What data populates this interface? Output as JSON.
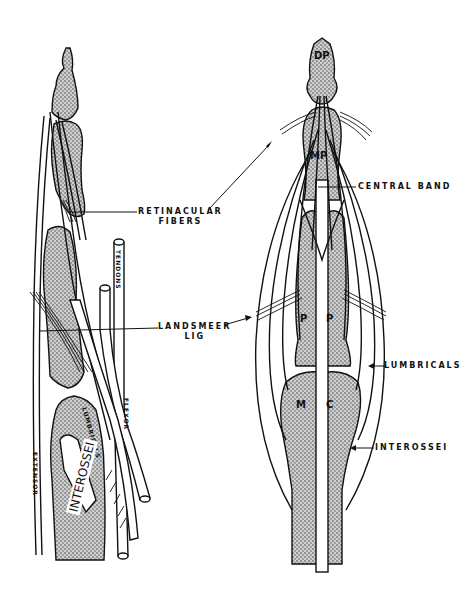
{
  "figure": {
    "left_view": {
      "description": "lateral view of finger",
      "labels": {
        "retinacular_fibers_line1": "RETINACULAR",
        "retinacular_fibers_line2": "FIBERS",
        "landsmeer_line1": "LANDSMEER",
        "landsmeer_line2": "LIG",
        "tendons": "TENDONS",
        "extensor": "EXTENSOR",
        "lumbricals": "LUMBRICALS",
        "flexor": "FLEXOR",
        "interossei": "INTEROSSEI"
      }
    },
    "right_view": {
      "description": "dorsal view of finger",
      "bone_labels": {
        "distal_phalanx": "DP",
        "middle_phalanx": "MP",
        "proximal_phalanx_left": "P",
        "proximal_phalanx_right": "P",
        "metacarpal_left": "M",
        "metacarpal_right": "C"
      },
      "labels": {
        "central_band": "CENTRAL BAND",
        "lumbricals": "LUMBRICALS",
        "interossei": "INTEROSSEI"
      }
    },
    "colors": {
      "line": "#111111",
      "bone_fill": "#b8b8b8",
      "background": "#ffffff"
    }
  }
}
